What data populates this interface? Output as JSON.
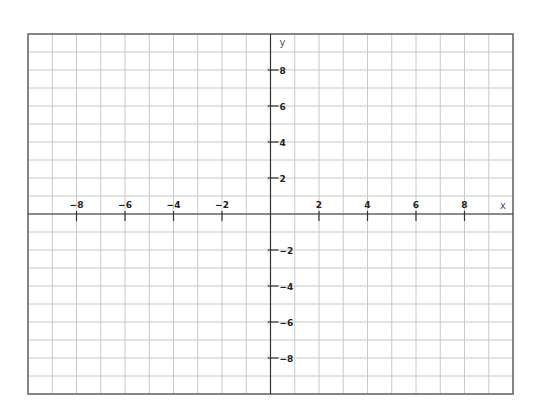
{
  "chart_data": {
    "type": "coordinate-grid",
    "title": "",
    "xlabel": "x",
    "ylabel": "y",
    "xlim": [
      -10,
      10
    ],
    "ylim": [
      -10,
      10
    ],
    "grid": true,
    "grid_step": 1,
    "x_ticks": [
      -8,
      -6,
      -4,
      -2,
      2,
      4,
      6,
      8
    ],
    "y_ticks": [
      8,
      6,
      4,
      2,
      -2,
      -4,
      -6,
      -8
    ],
    "x_tick_labels": [
      "-8",
      "-6",
      "-4",
      "-2",
      "2",
      "4",
      "6",
      "8"
    ],
    "y_tick_labels": [
      "8",
      "6",
      "4",
      "2",
      "-2",
      "-4",
      "-6",
      "-8"
    ],
    "series": [],
    "legend": null
  },
  "layout": {
    "frame": {
      "left": 28,
      "top": 34,
      "right": 513,
      "bottom": 394
    },
    "origin": {
      "x": 270.5,
      "y": 214
    },
    "unit_x": 24.25,
    "unit_y": 18,
    "colors": {
      "grid": "#c8c8c8",
      "axis": "#333333",
      "frame": "#666666",
      "text": "#222222"
    }
  }
}
